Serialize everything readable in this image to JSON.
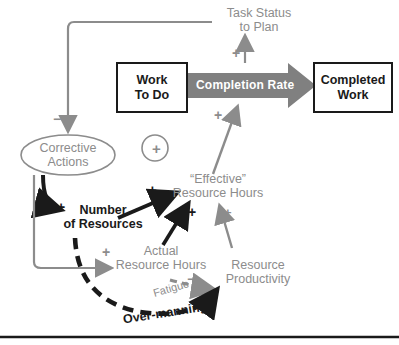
{
  "diagram": {
    "title_nodes": {
      "task_status": "Task Status\nto Plan",
      "work_to_do_l1": "Work",
      "work_to_do_l2": "To Do",
      "completion_rate": "Completion Rate",
      "completed_work_l1": "Completed",
      "completed_work_l2": "Work",
      "corrective_l1": "Corrective",
      "corrective_l2": "Actions",
      "number_res_l1": "Number",
      "number_res_l2": "of Resources",
      "effective_l1": "“Effective”",
      "effective_l2": "Resource Hours",
      "actual_l1": "Actual",
      "actual_l2": "Resource Hours",
      "productivity_l1": "Resource",
      "productivity_l2": "Productivity",
      "fatigue": "Fatigue",
      "over_manning": "Over-manning"
    },
    "loop_marker": "+",
    "signs": {
      "s_task_to_completion": "+",
      "s_corrective": "−",
      "s_number_of_resources": "+",
      "s_effective_from_number": "+",
      "s_effective_from_actual": "+",
      "s_effective_from_productivity": "+",
      "s_completion_from_effective": "+",
      "s_actual_from_corrective": "+",
      "s_fatigue": "−",
      "s_over_manning": "−"
    },
    "colors": {
      "gray": "#8c8c8c",
      "black": "#1a1a1a",
      "arrow_fill": "#808080",
      "white": "#ffffff"
    }
  }
}
